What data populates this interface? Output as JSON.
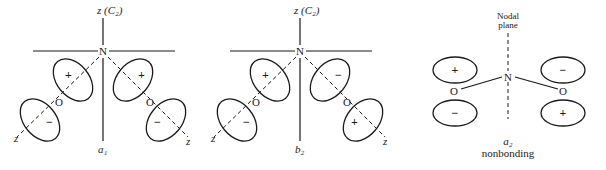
{
  "diagrams": [
    {
      "id": "a1",
      "axis_label": "z (C₂)",
      "center_atom": "N",
      "left_atom": "O",
      "right_atom": "O",
      "left_z": "z",
      "right_z": "z",
      "signs": {
        "upper_left": "+",
        "lower_left": "−",
        "upper_right": "+",
        "lower_right": "−"
      },
      "symmetry_label": "a₁"
    },
    {
      "id": "b2",
      "axis_label": "z (C₂)",
      "center_atom": "N",
      "left_atom": "O",
      "right_atom": "O",
      "left_z": "z",
      "right_z": "z",
      "signs": {
        "upper_left": "+",
        "lower_left": "−",
        "upper_right": "−",
        "lower_right": "+"
      },
      "symmetry_label": "b₂"
    },
    {
      "id": "a2",
      "plane_label_line1": "Nodal",
      "plane_label_line2": "plane",
      "center_atom": "N",
      "left_atom": "O",
      "right_atom": "O",
      "signs": {
        "upper_left": "+",
        "lower_left": "−",
        "upper_right": "−",
        "lower_right": "+"
      },
      "symmetry_label": "a₂",
      "description": "nonbonding"
    }
  ]
}
